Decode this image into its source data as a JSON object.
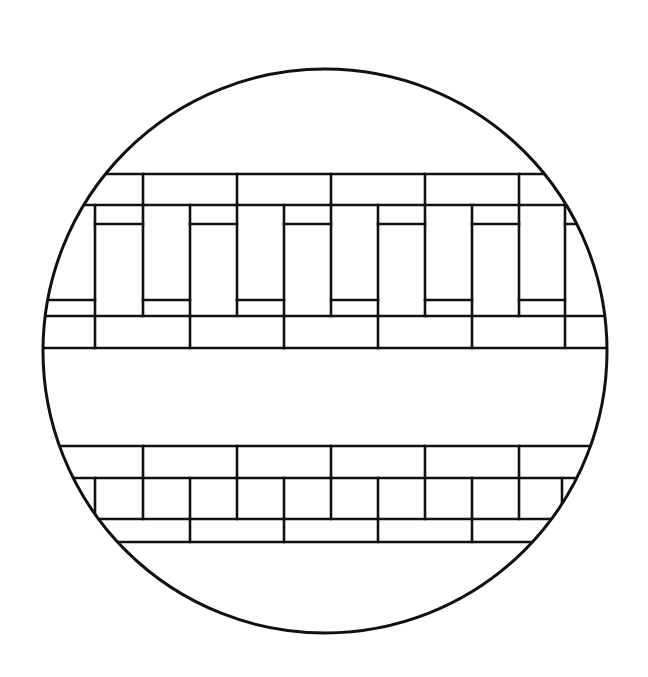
{
  "figure": {
    "title": "Circular stained-glass lattice pattern",
    "stroke_color": "#111111",
    "background": "#ffffff",
    "circle": {
      "cx": 325,
      "cy": 351,
      "r": 282,
      "stroke_width": 3
    },
    "line_width": 2.6,
    "upper_band": {
      "h_lines": [
        {
          "y": 174,
          "x1": 40,
          "x2": 610
        },
        {
          "y": 205,
          "x1": 40,
          "x2": 610
        },
        {
          "y": 316,
          "x1": 40,
          "x2": 610
        },
        {
          "y": 348,
          "x1": 40,
          "x2": 610
        }
      ],
      "top_row_verticals": [
        143,
        237,
        331,
        425,
        519
      ],
      "tall_verticals": [
        95,
        190,
        284,
        378,
        472,
        565
      ],
      "short_verticals": [
        143,
        237,
        331,
        425,
        519
      ],
      "upper_ledges": [
        [
          95,
          143
        ],
        [
          190,
          237
        ],
        [
          284,
          331
        ],
        [
          378,
          425
        ],
        [
          472,
          519
        ],
        [
          565,
          610
        ]
      ],
      "lower_ledges": [
        [
          40,
          95
        ],
        [
          143,
          190
        ],
        [
          237,
          284
        ],
        [
          331,
          378
        ],
        [
          425,
          472
        ],
        [
          519,
          565
        ]
      ],
      "upper_ledge_y": 224,
      "lower_ledge_y": 300
    },
    "lower_band": {
      "h_lines": [
        {
          "y": 446,
          "x1": 40,
          "x2": 610
        },
        {
          "y": 478,
          "x1": 40,
          "x2": 610
        },
        {
          "y": 519,
          "x1": 40,
          "x2": 610
        },
        {
          "y": 542,
          "x1": 40,
          "x2": 610
        }
      ],
      "row1_verticals": [
        143,
        237,
        331,
        425,
        519
      ],
      "row2_verticals": [
        95,
        143,
        190,
        237,
        284,
        331,
        378,
        425,
        472,
        519,
        562
      ],
      "row3_verticals": [
        190,
        284,
        378,
        472
      ]
    }
  }
}
